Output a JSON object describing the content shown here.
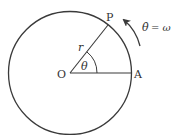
{
  "diagram": {
    "type": "circular-motion",
    "colors": {
      "stroke": "#3a3a3a",
      "text": "#333333",
      "background": "#ffffff"
    },
    "circle": {
      "cx": 70,
      "cy": 73,
      "r": 61.5
    },
    "points": {
      "center": {
        "label": "O",
        "x": 70,
        "y": 73
      },
      "moving": {
        "label": "P",
        "angle_deg": 51
      },
      "reference": {
        "label": "A"
      }
    },
    "labels": {
      "radius": "r",
      "angle": "θ",
      "angular_velocity_lhs": "θ̇",
      "angular_velocity_eq": "= ω"
    }
  }
}
